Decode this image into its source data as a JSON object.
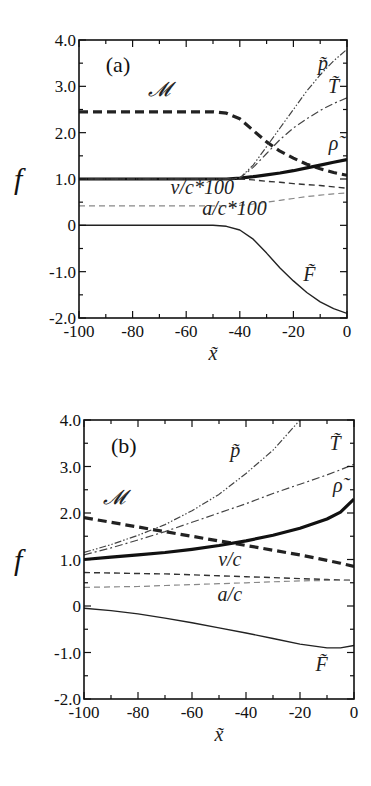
{
  "figure": {
    "panels": [
      "(a)",
      "(b)"
    ],
    "ylabel": "f",
    "xlabel": "x̃"
  },
  "colors": {
    "axis": "#111111",
    "M": "#222222",
    "rho": "#111111",
    "p": "#444444",
    "T": "#444444",
    "v": "#333333",
    "a": "#888888",
    "F": "#222222"
  },
  "chart_data": [
    {
      "type": "line",
      "title": "(a)",
      "xlabel": "x̃",
      "ylabel": "f",
      "xlim": [
        -100,
        0
      ],
      "ylim": [
        -2.0,
        4.0
      ],
      "xticks": [
        -100,
        -80,
        -60,
        -40,
        -20,
        0
      ],
      "xtick_labels": [
        "-100",
        "-80",
        "-60",
        "-40",
        "-20",
        "0"
      ],
      "yticks": [
        -2.0,
        -1.0,
        0,
        1.0,
        2.0,
        3.0,
        4.0
      ],
      "ytick_labels": [
        "-2.0",
        "-1.0",
        "0",
        "1.0",
        "2.0",
        "3.0",
        "4.0"
      ],
      "grid": false,
      "legend": "inline labels",
      "x": [
        -100,
        -90,
        -80,
        -70,
        -60,
        -50,
        -45,
        -40,
        -35,
        -30,
        -25,
        -20,
        -15,
        -10,
        -5,
        0
      ],
      "series": [
        {
          "name": "𝓜",
          "key": "M",
          "style": "thick-dashed",
          "label_pos": [
            -70,
            2.8
          ],
          "values": [
            2.45,
            2.45,
            2.45,
            2.45,
            2.45,
            2.45,
            2.42,
            2.3,
            2.05,
            1.8,
            1.6,
            1.45,
            1.32,
            1.22,
            1.14,
            1.08
          ]
        },
        {
          "name": "ρ̃",
          "key": "rho",
          "style": "thick-solid",
          "label_pos": [
            -5,
            1.62
          ],
          "values": [
            1.0,
            1.0,
            1.0,
            1.0,
            1.0,
            1.0,
            1.0,
            1.02,
            1.05,
            1.09,
            1.13,
            1.18,
            1.24,
            1.3,
            1.36,
            1.42
          ]
        },
        {
          "name": "p̃",
          "key": "p",
          "style": "dash-dot-dot",
          "label_pos": [
            -9,
            3.35
          ],
          "values": [
            1.0,
            1.0,
            1.0,
            1.0,
            1.0,
            1.0,
            1.0,
            1.02,
            1.3,
            1.7,
            2.1,
            2.5,
            2.9,
            3.25,
            3.55,
            3.8
          ]
        },
        {
          "name": "T̃",
          "key": "T",
          "style": "dash-dot",
          "label_pos": [
            -5,
            2.85
          ],
          "values": [
            1.0,
            1.0,
            1.0,
            1.0,
            1.0,
            1.0,
            1.0,
            1.02,
            1.25,
            1.55,
            1.85,
            2.1,
            2.3,
            2.48,
            2.63,
            2.75
          ]
        },
        {
          "name": "v/c*100",
          "key": "v",
          "style": "dashed",
          "label_pos": [
            -54,
            0.68
          ],
          "values": [
            1.0,
            1.0,
            1.0,
            1.0,
            1.0,
            1.0,
            1.0,
            1.0,
            0.98,
            0.95,
            0.93,
            0.9,
            0.88,
            0.86,
            0.83,
            0.8
          ]
        },
        {
          "name": "a/c*100",
          "key": "a",
          "style": "light-dashed",
          "label_pos": [
            -42,
            0.22
          ],
          "values": [
            0.42,
            0.42,
            0.42,
            0.42,
            0.42,
            0.42,
            0.42,
            0.43,
            0.46,
            0.5,
            0.54,
            0.58,
            0.62,
            0.65,
            0.68,
            0.7
          ]
        },
        {
          "name": "F̃",
          "key": "F",
          "style": "thin-solid",
          "label_pos": [
            -14,
            -1.2
          ],
          "values": [
            0.0,
            0.0,
            0.0,
            0.0,
            0.0,
            0.0,
            -0.02,
            -0.1,
            -0.3,
            -0.6,
            -0.92,
            -1.2,
            -1.45,
            -1.65,
            -1.8,
            -1.9
          ]
        }
      ]
    },
    {
      "type": "line",
      "title": "(b)",
      "xlabel": "x̃",
      "ylabel": "f",
      "xlim": [
        -100,
        0
      ],
      "ylim": [
        -2.0,
        4.0
      ],
      "xticks": [
        -100,
        -80,
        -60,
        -40,
        -20,
        0
      ],
      "xtick_labels": [
        "-100",
        "-80",
        "-60",
        "-40",
        "-20",
        "0"
      ],
      "yticks": [
        -2.0,
        -1.0,
        0,
        1.0,
        2.0,
        3.0,
        4.0
      ],
      "ytick_labels": [
        "-2.0",
        "-1.0",
        "0",
        "1.0",
        "2.0",
        "3.0",
        "4.0"
      ],
      "grid": false,
      "legend": "inline labels",
      "x": [
        -100,
        -90,
        -80,
        -70,
        -60,
        -50,
        -40,
        -30,
        -20,
        -10,
        -5,
        0
      ],
      "series": [
        {
          "name": "𝓜",
          "key": "M",
          "style": "thick-dashed",
          "label_pos": [
            -89,
            2.2
          ],
          "values": [
            1.9,
            1.8,
            1.7,
            1.6,
            1.5,
            1.4,
            1.3,
            1.2,
            1.1,
            0.98,
            0.92,
            0.85
          ]
        },
        {
          "name": "ρ̃",
          "key": "rho",
          "style": "thick-solid",
          "label_pos": [
            -6,
            2.45
          ],
          "values": [
            1.0,
            1.05,
            1.1,
            1.15,
            1.22,
            1.3,
            1.4,
            1.52,
            1.67,
            1.87,
            2.02,
            2.3
          ]
        },
        {
          "name": "p̃",
          "key": "p",
          "style": "dash-dot-dot",
          "label_pos": [
            -44,
            3.2
          ],
          "values": [
            1.15,
            1.32,
            1.52,
            1.75,
            2.05,
            2.4,
            2.85,
            3.35,
            4.0,
            null,
            null,
            null
          ]
        },
        {
          "name": "T̃",
          "key": "T",
          "style": "dash-dot",
          "label_pos": [
            -7,
            3.35
          ],
          "values": [
            1.1,
            1.25,
            1.42,
            1.6,
            1.8,
            2.0,
            2.2,
            2.42,
            2.62,
            2.82,
            2.93,
            3.05
          ]
        },
        {
          "name": "v/c",
          "key": "v",
          "style": "dashed",
          "label_pos": [
            -46,
            0.85
          ],
          "values": [
            0.72,
            0.71,
            0.7,
            0.69,
            0.67,
            0.65,
            0.63,
            0.61,
            0.59,
            0.57,
            0.56,
            0.55
          ]
        },
        {
          "name": "a/c",
          "key": "a",
          "style": "light-dashed",
          "label_pos": [
            -46,
            0.1
          ],
          "values": [
            0.4,
            0.41,
            0.42,
            0.44,
            0.46,
            0.48,
            0.5,
            0.52,
            0.54,
            0.55,
            0.55,
            0.55
          ]
        },
        {
          "name": "F̃",
          "key": "F",
          "style": "thin-solid",
          "label_pos": [
            -12,
            -1.4
          ],
          "values": [
            -0.05,
            -0.1,
            -0.17,
            -0.26,
            -0.36,
            -0.47,
            -0.58,
            -0.7,
            -0.82,
            -0.9,
            -0.9,
            -0.85
          ]
        }
      ]
    }
  ]
}
